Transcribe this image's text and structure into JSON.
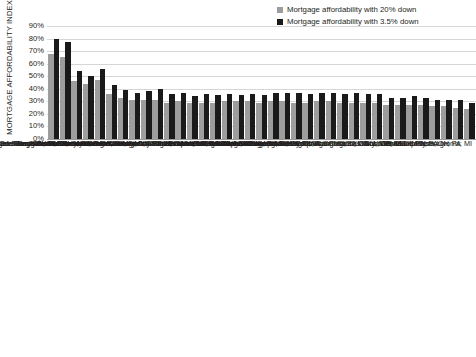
{
  "chart_data": {
    "type": "bar",
    "title": "",
    "ylabel": "MORTGAGE AFFORDABILITY INDEX",
    "xlabel": "",
    "ylim": [
      0,
      90
    ],
    "grid": true,
    "legend_position": "top-right",
    "yticks": [
      "90%",
      "80%",
      "70%",
      "60%",
      "50%",
      "40%",
      "30%",
      "20%",
      "10%",
      "0%"
    ],
    "legend": [
      {
        "name": "Mortgage affordability with 20% down",
        "color": "#9d9d9d"
      },
      {
        "name": "Mortgage affordability with 3.5% down",
        "color": "#1a1a1a"
      }
    ],
    "categories": [
      "San Francisco-Redwood City-South San Francisco; CA",
      "San Jose-Sunnyvale-Santa Clara; CA",
      "San Diego-Carlsbad; CA",
      "Oakland-Hayward-Berkeley; CA",
      "Los Angeles-Long Beach-Glendale; CA",
      "Miami-Miami Beach-Kendal; FL",
      "Seattle-Bellevue-Everett; WA",
      "Riverside-San Bernardino-Ontario; CA",
      "Nassau Country-Suffolk Country; NY",
      "Denver-Aurora-Lakewood; CO",
      "Portland-Vancouver-Hillsboro; OR-WA",
      "Sacramento-Roseville-Arden-Arcade; CA",
      "Las Vegas-Henderson-Paradise; NV",
      "Boston; MA",
      "New York-Jersey City-White Plains; NY-NJ",
      "Newark; NJ-PA",
      "Orlando-Kissimmee-Sanford; FL",
      "Phoenix-Mesa-Scottsdale; AZ",
      "Washington-Arlington-Alexandria; DC-VA-MD-WV",
      "Dallas-Plano-Irving; TX",
      "Tampa-St. Petersburg-Clearwater; FL",
      "Houston-The Woodlands-Sugar Land; TX",
      "San Antonio-New Braunfels; TX",
      "Chicago-Naperville-Arlington Heights; IL",
      "Charlotte-Concord-Gastonia;NC-SC",
      "Baltimore-Columbia-Towson; MD",
      "Fort Worth-Arlington; TX",
      "Atlanta-Sandy Springs-Roswell; GA",
      "Minneapolis-St. Paul-Bloomington; MN-WI",
      "Columbus; OH",
      "Kansas City; MO-KS",
      "St.Louis; MO-IL",
      "Cincinnati; OH-KY-IN",
      "Philadelphia; PA",
      "Cleveland-Elyria; OH",
      "Pittsburgh; PA",
      "Detroit-Dearborn-Livonia; MI"
    ],
    "series": [
      {
        "name": "Mortgage affordability with 20% down",
        "color": "#9d9d9d",
        "values": [
          68,
          65,
          46,
          44,
          47,
          36,
          33,
          31,
          31,
          31,
          29,
          30,
          29,
          29,
          29,
          30,
          30,
          30,
          29,
          30,
          30,
          29,
          29,
          30,
          30,
          29,
          29,
          29,
          29,
          27,
          27,
          27,
          27,
          26,
          26,
          25,
          24
        ]
      },
      {
        "name": "Mortgage affordability with 3.5% down",
        "color": "#1a1a1a",
        "values": [
          80,
          77,
          54,
          50,
          56,
          43,
          39,
          37,
          38,
          40,
          36,
          37,
          34,
          36,
          35,
          36,
          35,
          36,
          35,
          37,
          37,
          37,
          36,
          37,
          37,
          36,
          37,
          36,
          36,
          33,
          33,
          34,
          33,
          31,
          31,
          31,
          29
        ]
      }
    ]
  }
}
